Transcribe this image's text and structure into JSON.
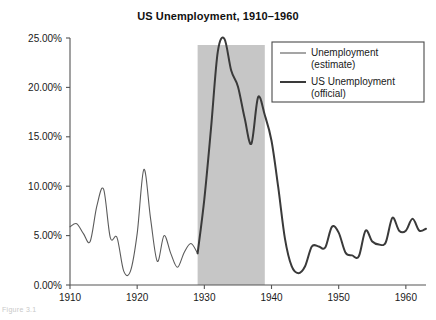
{
  "figure": {
    "title": "US Unemployment, 1910–1960",
    "caption": "Figure 3.1"
  },
  "colors": {
    "axis": "#555555",
    "line_estimate": "#5b5b5b",
    "line_official": "#3a3a3a",
    "band_fill": "#c6c6c6",
    "legend_border": "#4a4a4a",
    "background": "#ffffff"
  },
  "legend": {
    "position": "top-right",
    "entries": [
      {
        "label_line1": "Unemployment",
        "label_line2": "(estimate)",
        "series": "estimate"
      },
      {
        "label_line1": "US Unemployment",
        "label_line2": "(official)",
        "series": "official"
      }
    ]
  },
  "chart_data": {
    "type": "line",
    "title": "US Unemployment, 1910–1960",
    "xlabel": "",
    "ylabel": "",
    "xlim": [
      1910,
      1963
    ],
    "ylim": [
      0,
      25
    ],
    "grid": false,
    "xticks": [
      1910,
      1920,
      1930,
      1940,
      1950,
      1960
    ],
    "xtick_labels": [
      "1910",
      "1920",
      "1930",
      "1940",
      "1950",
      "1960"
    ],
    "yticks": [
      0,
      5,
      10,
      15,
      20,
      25
    ],
    "ytick_labels": [
      "0.00%",
      "5.00%",
      "10.00%",
      "15.00%",
      "20.00%",
      "25.00%"
    ],
    "annotations": [
      {
        "type": "vspan",
        "label": "Great Depression",
        "x_start": 1929,
        "x_end": 1939,
        "color": "#c6c6c6"
      }
    ],
    "series": [
      {
        "name": "Unemployment (estimate)",
        "linewidth": 1.1,
        "x": [
          1910,
          1911,
          1912,
          1913,
          1914,
          1915,
          1916,
          1917,
          1918,
          1919,
          1920,
          1921,
          1922,
          1923,
          1924,
          1925,
          1926,
          1927,
          1928,
          1929
        ],
        "values": [
          5.9,
          6.2,
          5.2,
          4.4,
          8.0,
          9.7,
          4.8,
          4.8,
          1.4,
          1.4,
          5.2,
          11.7,
          6.7,
          2.4,
          5.0,
          3.2,
          1.8,
          3.3,
          4.2,
          3.2
        ]
      },
      {
        "name": "US Unemployment (official)",
        "linewidth": 2.0,
        "x": [
          1929,
          1930,
          1931,
          1932,
          1933,
          1934,
          1935,
          1936,
          1937,
          1938,
          1939,
          1940,
          1941,
          1942,
          1943,
          1944,
          1945,
          1946,
          1947,
          1948,
          1949,
          1950,
          1951,
          1952,
          1953,
          1954,
          1955,
          1956,
          1957,
          1958,
          1959,
          1960,
          1961,
          1962,
          1963
        ],
        "values": [
          3.2,
          8.7,
          15.9,
          23.6,
          24.9,
          21.7,
          20.1,
          16.9,
          14.3,
          19.0,
          17.2,
          14.6,
          9.9,
          4.7,
          1.9,
          1.2,
          1.9,
          3.9,
          3.9,
          3.8,
          5.9,
          5.3,
          3.3,
          3.0,
          2.9,
          5.5,
          4.4,
          4.1,
          4.3,
          6.8,
          5.5,
          5.5,
          6.7,
          5.5,
          5.7
        ]
      }
    ]
  }
}
